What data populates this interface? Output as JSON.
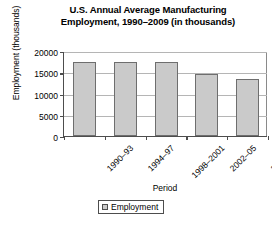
{
  "chart_data": {
    "type": "bar",
    "title": "U.S. Annual Average Manufacturing Employment, 1990–2009 (in thousands)",
    "title_line1": "U.S. Annual Average Manufacturing",
    "title_line2": "Employment, 1990–2009 (in thousands)",
    "xlabel": "Period",
    "ylabel": "Employment (thousands)",
    "categories": [
      "1990–93",
      "1994–97",
      "1998–2001",
      "2002–05",
      "2006–09"
    ],
    "values": [
      17300,
      17400,
      17500,
      14700,
      13300
    ],
    "series": [
      {
        "name": "Employment",
        "values": [
          17300,
          17400,
          17500,
          14700,
          13300
        ]
      }
    ],
    "ylim": [
      0,
      20000
    ],
    "ytick_values": [
      0,
      5000,
      10000,
      15000,
      20000
    ],
    "ytick_labels": [
      "0",
      "5000",
      "10000",
      "15000",
      "20000"
    ],
    "grid": true,
    "legend": [
      "Employment"
    ],
    "legend_position": "bottom-center",
    "bar_color": "#cacaca",
    "bar_border_color": "#6e6e6e",
    "axis_color": "#4d4d4d",
    "grid_color": "#b5b5b5"
  },
  "legend": {
    "label": "Employment"
  }
}
